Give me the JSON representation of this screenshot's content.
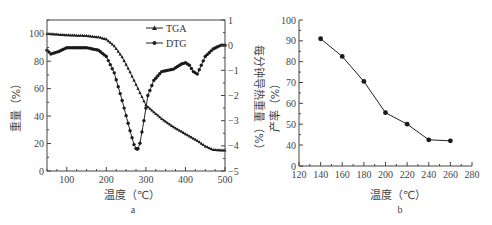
{
  "chart_data": [
    {
      "id": "a",
      "type": "line",
      "caption": "a",
      "xlabel": "温度（℃）",
      "ylabel": "重量（%）",
      "y2label": "每分钟导热重量（%）",
      "xlim": [
        50,
        500
      ],
      "ylim": [
        0,
        110
      ],
      "y2lim": [
        -5,
        1
      ],
      "xticks": [
        100,
        200,
        300,
        400,
        500
      ],
      "yticks": [
        0,
        20,
        40,
        60,
        80,
        100
      ],
      "y2ticks": [
        1,
        0,
        -1,
        -2,
        -3,
        -4,
        -5
      ],
      "legend": {
        "position": "upper-center",
        "entries": [
          "TGA",
          "DTG"
        ]
      },
      "grid": false,
      "series": [
        {
          "name": "TGA",
          "axis": "left",
          "marker": "triangle",
          "x": [
            50,
            100,
            150,
            180,
            200,
            220,
            240,
            260,
            280,
            300,
            320,
            340,
            370,
            400,
            430,
            450,
            470,
            500
          ],
          "values": [
            100,
            99,
            98.5,
            97.5,
            96,
            91,
            83,
            72,
            60,
            48,
            43,
            38,
            32,
            27,
            22,
            18,
            15.5,
            15
          ]
        },
        {
          "name": "DTG",
          "axis": "right",
          "marker": "circle",
          "x": [
            50,
            60,
            80,
            100,
            150,
            180,
            200,
            220,
            240,
            260,
            270,
            278,
            285,
            295,
            305,
            320,
            340,
            370,
            390,
            400,
            410,
            420,
            430,
            440,
            450,
            470,
            490,
            500
          ],
          "values": [
            -0.2,
            -0.35,
            -0.25,
            -0.1,
            -0.1,
            -0.2,
            -0.45,
            -1.1,
            -2.2,
            -3.4,
            -3.95,
            -4.2,
            -3.9,
            -3.0,
            -2.0,
            -1.4,
            -1.05,
            -0.95,
            -0.75,
            -0.7,
            -0.8,
            -1.05,
            -1.15,
            -0.8,
            -0.45,
            -0.15,
            0.0,
            0.0
          ]
        }
      ]
    },
    {
      "id": "b",
      "type": "line",
      "caption": "b",
      "xlabel": "温度（℃）",
      "ylabel": "产率（%）",
      "xlim": [
        120,
        280
      ],
      "ylim": [
        0,
        100
      ],
      "y_axis_break": "0 then 40-100",
      "xticks": [
        120,
        140,
        160,
        180,
        200,
        220,
        240,
        260,
        280
      ],
      "yticks": [
        0,
        40,
        50,
        60,
        70,
        80,
        90,
        100
      ],
      "grid": false,
      "series": [
        {
          "name": "产率",
          "marker": "circle",
          "x": [
            140,
            160,
            180,
            200,
            220,
            240,
            260
          ],
          "values": [
            91,
            82.5,
            70.5,
            55.5,
            50,
            42.5,
            42
          ]
        }
      ]
    }
  ],
  "labels": {
    "a": {
      "xlabel": "温度（℃）",
      "ylabel": "重量（%）",
      "y2label": "每分钟导热重量（%）",
      "caption": "a",
      "legend_tga": "TGA",
      "legend_dtg": "DTG"
    },
    "b": {
      "xlabel": "温度（℃）",
      "ylabel": "产率（%）",
      "caption": "b"
    }
  },
  "colors": {
    "axis": "#444444",
    "line": "#222222",
    "marker": "#1a1a1a"
  }
}
